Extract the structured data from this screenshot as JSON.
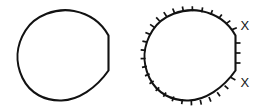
{
  "canvas": {
    "width": 271,
    "height": 110,
    "background": "#ffffff",
    "ink": "#121212"
  },
  "figures": [
    {
      "id": "plain-curve",
      "name": "left-plain-closed-curve",
      "description": "Closed convex curve with a straight vertical right edge and two corner vertices",
      "stroke": "#121212",
      "stroke_width": 2.1,
      "has_ticks": false,
      "labels": []
    },
    {
      "id": "hatched-curve",
      "name": "right-hatched-closed-curve",
      "description": "Same closed curve with outward hatch tick marks distributed along the boundary and two corner labels",
      "stroke": "#121212",
      "stroke_width": 2.1,
      "has_ticks": true,
      "tick_count": 30,
      "tick_length": 5,
      "labels": [
        {
          "text": "X",
          "position": "upper-corner"
        },
        {
          "text": "X",
          "position": "lower-corner"
        }
      ]
    }
  ],
  "labels": {
    "upper_corner": "X",
    "lower_corner": "X"
  }
}
